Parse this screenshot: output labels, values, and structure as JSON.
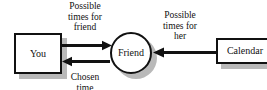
{
  "diagram": {
    "background_color": "#ffffff",
    "stroke_color": "#111111",
    "shadow_color": "#b9b9b9",
    "nodes": [
      {
        "id": "you",
        "label": "You",
        "shape": "rect"
      },
      {
        "id": "friend",
        "label": "Friend",
        "shape": "circle"
      },
      {
        "id": "calendar",
        "label": "Calendar",
        "shape": "rect"
      }
    ],
    "edges": [
      {
        "id": "you-to-friend",
        "from": "You",
        "to": "Friend",
        "direction": "right",
        "label": "Possible\ntimes for\nfriend"
      },
      {
        "id": "friend-to-you",
        "from": "Friend",
        "to": "You",
        "direction": "left",
        "label": "Chosen\ntime"
      },
      {
        "id": "calendar-to-friend",
        "from": "Calendar",
        "to": "Friend",
        "direction": "left",
        "label": "Possible\ntimes for\nher"
      }
    ]
  }
}
